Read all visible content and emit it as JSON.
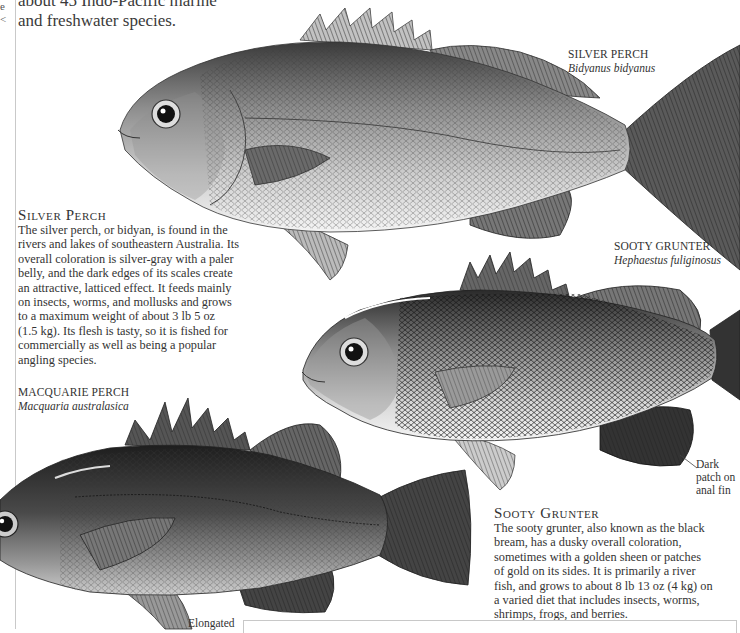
{
  "page": {
    "intro_lines": [
      "about 45 Indo-Pacific marine",
      "and freshwater species."
    ],
    "edge_glyphs": [
      "e",
      "<"
    ]
  },
  "species": [
    {
      "id": "silver-perch",
      "label": "SILVER PERCH",
      "latin": "Bidyanus bidyanus",
      "heading": "Silver Perch",
      "description": "The silver perch, or bidyan, is found in the rivers and lakes of southeastern Australia. Its overall coloration is silver-gray with a paler belly, and the dark edges of its scales create an attractive, latticed effect. It feeds mainly on insects, worms, and mollusks and grows to a maximum weight of about 3 lb 5 oz (1.5 kg). Its flesh is tasty, so it is fished for commercially as well as being a popular angling species.",
      "description_lines": [
        "The silver perch, or bidyan, is found in the",
        "rivers and lakes of southeastern Australia. Its",
        "overall coloration is silver-gray with a paler",
        "belly, and the dark edges of its scales create",
        "an attractive, latticed effect. It feeds mainly",
        "on insects, worms, and mollusks and grows",
        "to a maximum weight of about 3 lb 5 oz",
        "(1.5 kg). Its flesh is tasty, so it is fished for",
        "commercially as well as being a popular",
        "angling species."
      ]
    },
    {
      "id": "sooty-grunter",
      "label": "SOOTY GRUNTER",
      "latin": "Hephaestus fuliginosus",
      "heading": "Sooty Grunter",
      "description": "The sooty grunter, also known as the black bream, has a dusky overall coloration, sometimes with a golden sheen or patches of gold on its sides. It is primarily a river fish, and grows to about 8 lb 13 oz (4 kg) on a varied diet that includes insects, worms, shrimps, frogs, and berries.",
      "description_lines": [
        "The sooty grunter, also known as the black",
        "bream, has a dusky overall coloration,",
        "sometimes with a golden sheen or patches",
        "of gold on its sides. It is primarily a river",
        "fish, and grows to about 8 lb 13 oz (4 kg) on",
        "a varied diet that includes insects, worms,",
        "shrimps, frogs, and berries."
      ],
      "callout": [
        "Dark",
        "patch on",
        "anal fin"
      ]
    },
    {
      "id": "macquarie-perch",
      "label": "MACQUARIE PERCH",
      "latin": "Macquaria australasica",
      "callout": [
        "Elongated"
      ]
    }
  ],
  "colors": {
    "paper": "#ffffff",
    "text": "#333333",
    "rule": "#c9c9c9",
    "fish_dark": "#2b2b2b",
    "fish_mid": "#8a8a8a",
    "fish_light": "#e6e6e6"
  }
}
